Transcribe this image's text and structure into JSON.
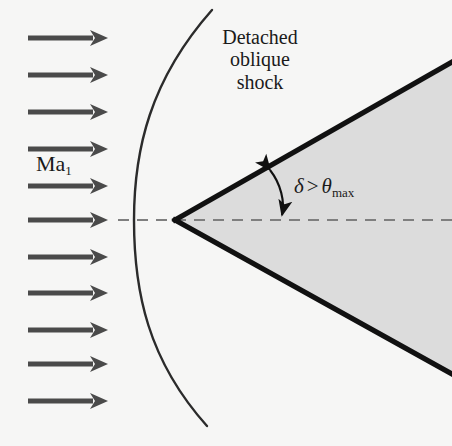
{
  "figure": {
    "background_color": "#f6f6f5",
    "wedge_fill_color": "#dcdcdc",
    "line_color": "#111111",
    "arrow_color": "#4a4a4a",
    "dashed_color": "#808080"
  },
  "labels": {
    "shock_label": "Detached oblique shock",
    "shock_label_line1": "Detached",
    "shock_label_line2": "oblique",
    "shock_label_line3": "shock",
    "mach_symbol": "Ma",
    "mach_subscript": "1",
    "angle_delta": "δ",
    "angle_relation": ">",
    "angle_theta": "θ",
    "angle_theta_subscript": "max",
    "angle_full": "δ > θmax"
  },
  "geometry": {
    "image_width": 452,
    "image_height": 446,
    "centerline_y": 220,
    "wedge_apex": [
      175,
      220
    ],
    "wedge_upper_end": [
      452,
      62
    ],
    "wedge_lower_end": [
      452,
      374
    ],
    "wedge_half_angle_deg": 29.7,
    "shock_curve_top": [
      212,
      10
    ],
    "shock_curve_nose": [
      134,
      220
    ],
    "shock_curve_bottom": [
      207,
      426
    ],
    "dashed_centerline_start_x": 118,
    "dashed_centerline_end_x": 452,
    "angle_arc_start": [
      269,
      168
    ],
    "angle_arc_end": [
      281,
      219
    ]
  },
  "flow_arrows": {
    "count": 11,
    "x_start": 28,
    "x_end": 108,
    "y_positions": [
      38,
      75,
      112,
      149,
      186,
      220,
      257,
      293,
      330,
      364,
      401
    ],
    "shaft_thickness": 5,
    "head_length": 18,
    "head_half_width": 8,
    "direction": "right"
  },
  "icons": {
    "flow_arrow": "arrow-right-icon",
    "angle_arrow": "double-headed-arc-arrow-icon"
  }
}
